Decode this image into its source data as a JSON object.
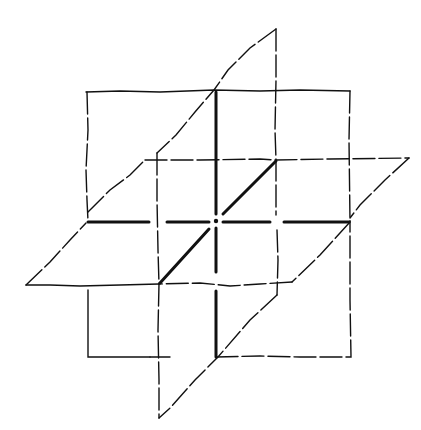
{
  "figure": {
    "title": "",
    "stroke_color": "#111111",
    "background": "#ffffff"
  },
  "planes": {
    "frontal": {
      "points": [
        [
          86,
          91
        ],
        [
          350,
          91
        ],
        [
          350,
          357
        ],
        [
          86,
          357
        ]
      ]
    },
    "sagittal": {
      "points": [
        [
          276,
          29
        ],
        [
          276,
          295
        ],
        [
          159,
          418
        ],
        [
          159,
          153
        ]
      ]
    },
    "horizontal": {
      "points": [
        [
          145,
          160
        ],
        [
          409,
          158
        ],
        [
          292,
          282
        ],
        [
          26,
          285
        ]
      ]
    }
  },
  "axes": {
    "center": [
      216,
      221
    ],
    "vertical": {
      "from": [
        216,
        91
      ],
      "to": [
        216,
        357
      ]
    },
    "horizontal": {
      "from": [
        86,
        221
      ],
      "to": [
        350,
        221
      ]
    },
    "depth": {
      "from": [
        276,
        160
      ],
      "to": [
        159,
        284
      ]
    }
  }
}
